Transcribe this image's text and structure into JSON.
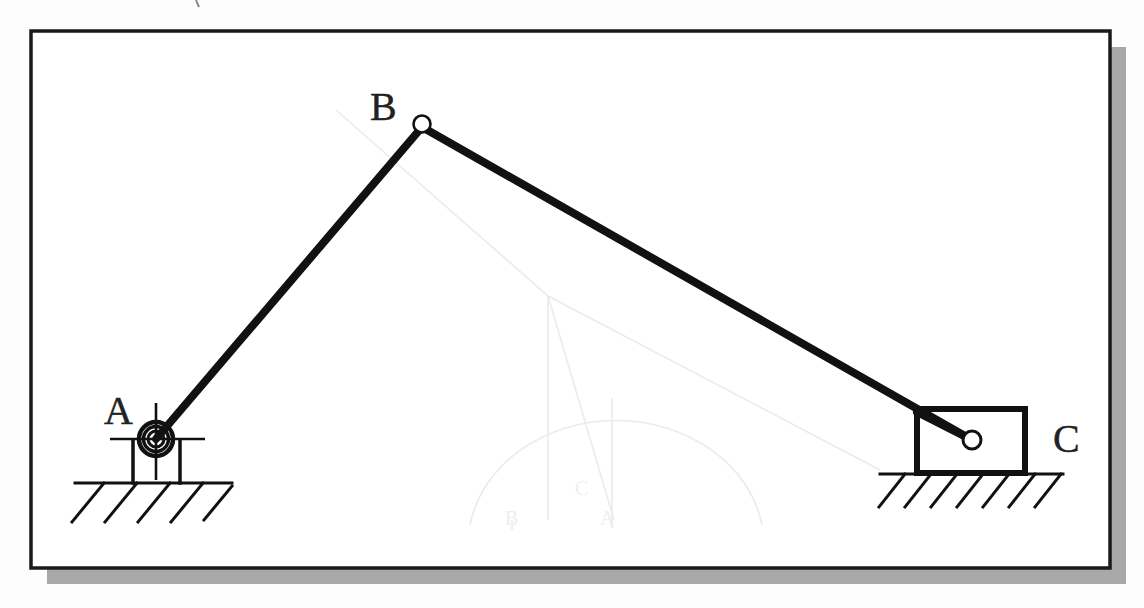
{
  "page": {
    "background_color": "#fdfdfd",
    "paper_tone": "#fbfbfb"
  },
  "frame": {
    "name": "drawing-border",
    "x": 31,
    "y": 31,
    "width": 1079,
    "height": 537,
    "stroke_color": "#1a1a1a",
    "stroke_width": 3.5,
    "fill": "#ffffff",
    "shadow_color": "#a8a8a8",
    "shadow_offset_x": 16,
    "shadow_offset_y": 16
  },
  "labels": [
    {
      "id": "label-A",
      "text": "A",
      "x": 104,
      "y": 423,
      "font_size": 40
    },
    {
      "id": "label-B",
      "text": "B",
      "x": 379,
      "y": 118,
      "font_size": 40
    },
    {
      "id": "label-C",
      "text": "C",
      "x": 1063,
      "y": 434,
      "font_size": 40
    }
  ],
  "joints": {
    "A": {
      "name": "fixed-pivot-A",
      "cx": 156,
      "cy": 439,
      "outer_r": 17,
      "mid_r": 12.5,
      "inner_r": 8
    },
    "B": {
      "name": "pin-joint-B",
      "cx": 422,
      "cy": 127,
      "r": 8.5
    },
    "C": {
      "name": "pin-joint-C",
      "cx": 972,
      "cy": 440,
      "r": 9
    }
  },
  "links": [
    {
      "id": "link-AB",
      "name": "crank-link-AB",
      "x1": 156,
      "y1": 439,
      "x2": 422,
      "y2": 127,
      "stroke_width": 8,
      "color": "#111111"
    },
    {
      "id": "link-BC",
      "name": "coupler-link-BC",
      "x1": 422,
      "y1": 127,
      "x2": 972,
      "y2": 440,
      "stroke_width": 8,
      "color": "#111111"
    }
  ],
  "support_A": {
    "name": "bearing-support-A",
    "bracket_left_x": 133,
    "bracket_right_x": 180,
    "bracket_top_y": 439,
    "ground_y": 483,
    "centerline_h_x1": 112,
    "centerline_h_x2": 203,
    "centerline_v_y1": 404,
    "centerline_v_y2": 478,
    "ground_line_x1": 75,
    "ground_line_x2": 232,
    "hatch_count": 5,
    "hatch_len": 42,
    "stroke_width": 3
  },
  "slider_C": {
    "name": "slider-block-C",
    "x": 917,
    "y": 409,
    "width": 108,
    "height": 64,
    "stroke_width": 6,
    "fill": "#ffffff",
    "ground_y": 474,
    "ground_line_x1": 880,
    "ground_line_x2": 1063,
    "hatch_count": 7,
    "hatch_len": 40,
    "stroke_width_ground": 3
  },
  "ghost_lines": {
    "name": "bleed-through-construction-lines",
    "color": "#e9e9ec",
    "opacity": 0.85,
    "paths": [
      "M 336 110 L 548 296",
      "M 548 296 L 548 520",
      "M 548 296 L 880 470",
      "M 548 296 L 612 520",
      "M 612 400 L 612 525",
      "M 470 522 A 145 120 0 0 1 760 522"
    ]
  },
  "chart_data": {
    "type": "diagram",
    "nodes": [
      {
        "label": "A",
        "x": 156,
        "y": 439,
        "kind": "fixed-pivot"
      },
      {
        "label": "B",
        "x": 422,
        "y": 127,
        "kind": "pin-joint"
      },
      {
        "label": "C",
        "x": 972,
        "y": 440,
        "kind": "slider-pin"
      }
    ],
    "edges": [
      {
        "from": "A",
        "to": "B",
        "kind": "rigid-link"
      },
      {
        "from": "B",
        "to": "C",
        "kind": "rigid-link"
      }
    ],
    "grounds": [
      {
        "at": "A",
        "y": 483,
        "kind": "hatched-ground"
      },
      {
        "at": "C",
        "y": 474,
        "kind": "hatched-ground"
      }
    ]
  }
}
